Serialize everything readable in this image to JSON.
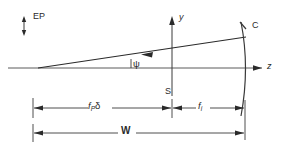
{
  "figure": {
    "type": "optical-ray-diagram",
    "background_color": "#ffffff",
    "line_color": "#3a3a3a"
  },
  "axes": {
    "horizontal": {
      "name": "optical-axis",
      "label": "z",
      "arrow": "right",
      "y_px": 68,
      "x_start_px": 8,
      "x_end_px": 268
    },
    "vertical": {
      "name": "transverse-axis",
      "label": "y",
      "arrow": "up",
      "x_px": 172,
      "y_top_px": 16,
      "y_bottom_px": 96
    }
  },
  "elements": {
    "entrance_pupil": {
      "label": "EP",
      "marker": "double-headed-vertical-arrow"
    },
    "stop": {
      "label": "S"
    },
    "mirror": {
      "label": "C",
      "shape": "concave-arc",
      "vertex_x_px": 247
    },
    "ray": {
      "label": "chief-ray",
      "arrow": "left",
      "origin_x_px": 38,
      "origin_y_px": 68,
      "end_x_px": 246,
      "end_y_px": 37
    },
    "angle": {
      "label": "ψ",
      "name": "field-angle"
    }
  },
  "dimensions": [
    {
      "id": "fp-delta",
      "label_main": "f",
      "label_sub": "P",
      "label_tail": "δ",
      "full_text": "f_P δ",
      "from_px": 33,
      "to_px": 172,
      "row_y_px": 108
    },
    {
      "id": "fi",
      "label_main": "f",
      "label_sub": "i",
      "label_tail": "",
      "full_text": "f_i",
      "from_px": 172,
      "to_px": 245,
      "row_y_px": 108
    },
    {
      "id": "W",
      "label_main": "W",
      "label_sub": "",
      "label_tail": "",
      "full_text": "W",
      "from_px": 33,
      "to_px": 245,
      "row_y_px": 133
    }
  ]
}
